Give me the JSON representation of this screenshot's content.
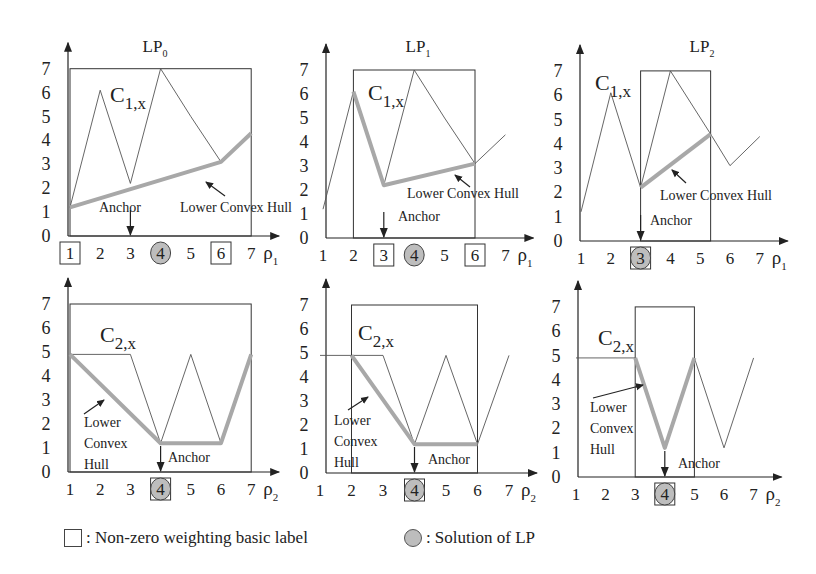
{
  "chart_data": [
    {
      "id": "lp0_c1",
      "type": "line",
      "title": "LP0",
      "title_main": "LP",
      "title_sub": "0",
      "curve_label_main": "C",
      "curve_label_sub": "1,x",
      "xlabel_main": "ρ",
      "xlabel_sub": "1",
      "x_ticks": [
        "1",
        "2",
        "3",
        "4",
        "5",
        "6",
        "7"
      ],
      "y_ticks": [
        "0",
        "1",
        "2",
        "3",
        "4",
        "5",
        "6",
        "7"
      ],
      "ylim": [
        0,
        7
      ],
      "curve": [
        [
          1,
          1.2
        ],
        [
          2,
          6.1
        ],
        [
          3,
          2.2
        ],
        [
          4,
          7
        ],
        [
          5,
          5
        ],
        [
          6,
          3.1
        ],
        [
          7,
          4.3
        ]
      ],
      "lower_convex_hull": [
        [
          1,
          1.2
        ],
        [
          6,
          3.1
        ],
        [
          7,
          4.3
        ]
      ],
      "box_x": [
        1,
        7
      ],
      "boxed_labels": [
        "1",
        "6"
      ],
      "solution_label": "4",
      "anchor_x": 3,
      "anchor_text": "Anchor",
      "hull_text": "Lower Convex Hull",
      "layout": {
        "ox": 68,
        "oy": 236,
        "x1": 70,
        "dx": 30.2,
        "dy": 23.9,
        "title_x": 155,
        "title_y": 52,
        "label_x": 110,
        "label_y": 102,
        "anchor_tx": 99,
        "anchor_ty": 212,
        "hull_tx": 180,
        "hull_ty": 212,
        "hull_arrow": [
          [
            225,
            196
          ],
          [
            206,
            182
          ]
        ]
      }
    },
    {
      "id": "lp1_c1",
      "type": "line",
      "title": "LP1",
      "title_main": "LP",
      "title_sub": "1",
      "curve_label_main": "C",
      "curve_label_sub": "1,x",
      "xlabel_main": "ρ",
      "xlabel_sub": "1",
      "x_ticks": [
        "1",
        "2",
        "3",
        "4",
        "5",
        "6",
        "7"
      ],
      "y_ticks": [
        "0",
        "1",
        "2",
        "3",
        "4",
        "5",
        "6",
        "7"
      ],
      "ylim": [
        0,
        7
      ],
      "curve": [
        [
          1,
          1.2
        ],
        [
          2,
          6.1
        ],
        [
          3,
          2.2
        ],
        [
          4,
          7
        ],
        [
          5,
          5
        ],
        [
          6,
          3.1
        ],
        [
          7,
          4.3
        ]
      ],
      "lower_convex_hull": [
        [
          2,
          6.1
        ],
        [
          3,
          2.2
        ],
        [
          6,
          3.1
        ]
      ],
      "box_x": [
        2,
        6
      ],
      "boxed_labels": [
        "3",
        "6"
      ],
      "solution_label": "4",
      "anchor_x": 3,
      "anchor_text": "Anchor",
      "hull_text": "Lower Convex Hull",
      "layout": {
        "ox": 326,
        "oy": 238,
        "x1": 323,
        "dx": 30.4,
        "dy": 24,
        "title_x": 418,
        "title_y": 52,
        "label_x": 368,
        "label_y": 100,
        "anchor_tx": 398,
        "anchor_ty": 221,
        "hull_tx": 407,
        "hull_ty": 198,
        "hull_arrow": [
          [
            470,
            187
          ],
          [
            455,
            175
          ]
        ]
      }
    },
    {
      "id": "lp2_c1",
      "type": "line",
      "title": "LP2",
      "title_main": "LP",
      "title_sub": "2",
      "curve_label_main": "C",
      "curve_label_sub": "1,x",
      "xlabel_main": "ρ",
      "xlabel_sub": "1",
      "x_ticks": [
        "1",
        "2",
        "3",
        "4",
        "5",
        "6",
        "7"
      ],
      "y_ticks": [
        "0",
        "1",
        "2",
        "3",
        "4",
        "5",
        "6",
        "7"
      ],
      "ylim": [
        0,
        7
      ],
      "curve": [
        [
          1,
          1.2
        ],
        [
          2,
          6.1
        ],
        [
          3,
          2.2
        ],
        [
          4,
          7
        ],
        [
          5.35,
          4.4
        ],
        [
          6,
          3.1
        ],
        [
          7,
          4.3
        ]
      ],
      "lower_convex_hull": [
        [
          3,
          2.2
        ],
        [
          5.35,
          4.4
        ]
      ],
      "box_x": [
        3,
        5.35
      ],
      "boxed_labels": [
        "3"
      ],
      "solution_label": "3",
      "anchor_x": 3,
      "anchor_text": "Anchor",
      "hull_text": "Lower Convex Hull",
      "layout": {
        "ox": 580,
        "oy": 241,
        "x1": 581,
        "dx": 29.8,
        "dy": 24.3,
        "title_x": 702,
        "title_y": 52,
        "label_x": 595,
        "label_y": 90,
        "anchor_tx": 650,
        "anchor_ty": 225,
        "hull_tx": 660,
        "hull_ty": 200,
        "hull_arrow": [
          [
            686,
            183
          ],
          [
            672,
            170
          ]
        ]
      }
    },
    {
      "id": "lp0_c2",
      "type": "line",
      "curve_label_main": "C",
      "curve_label_sub": "2,x",
      "xlabel_main": "ρ",
      "xlabel_sub": "2",
      "x_ticks": [
        "1",
        "2",
        "3",
        "4",
        "5",
        "6",
        "7"
      ],
      "y_ticks": [
        "0",
        "1",
        "2",
        "3",
        "4",
        "5",
        "6",
        "7"
      ],
      "ylim": [
        0,
        7
      ],
      "curve": [
        [
          1,
          4.9
        ],
        [
          3,
          4.9
        ],
        [
          4,
          1.2
        ],
        [
          5,
          4.9
        ],
        [
          6,
          1.2
        ],
        [
          7,
          4.9
        ]
      ],
      "lower_convex_hull": [
        [
          1,
          4.9
        ],
        [
          4,
          1.2
        ],
        [
          6,
          1.2
        ],
        [
          7,
          4.9
        ]
      ],
      "box_x": [
        1,
        7
      ],
      "boxed_labels": [
        "4"
      ],
      "solution_label": "4",
      "anchor_x": 4,
      "anchor_text": "Anchor",
      "hull_text": [
        "Lower",
        "Convex",
        "Hull"
      ],
      "layout": {
        "ox": 68,
        "oy": 472,
        "x1": 70,
        "dx": 30.2,
        "dy": 24,
        "label_x": 100,
        "label_y": 342,
        "anchor_tx": 168,
        "anchor_ty": 462,
        "hull_tx": 84,
        "hull_ty": 427,
        "hull_arrow": [
          [
            84,
            414
          ],
          [
            104,
            400
          ]
        ]
      }
    },
    {
      "id": "lp1_c2",
      "type": "line",
      "curve_label_main": "C",
      "curve_label_sub": "2,x",
      "xlabel_main": "ρ",
      "xlabel_sub": "2",
      "x_ticks": [
        "1",
        "2",
        "3",
        "4",
        "5",
        "6",
        "7"
      ],
      "y_ticks": [
        "0",
        "1",
        "2",
        "3",
        "4",
        "5",
        "6",
        "7"
      ],
      "ylim": [
        0,
        7
      ],
      "curve": [
        [
          1,
          4.9
        ],
        [
          3,
          4.9
        ],
        [
          4,
          1.2
        ],
        [
          5,
          4.9
        ],
        [
          6,
          1.2
        ],
        [
          7,
          4.9
        ]
      ],
      "lower_convex_hull": [
        [
          2,
          4.9
        ],
        [
          4,
          1.2
        ],
        [
          6,
          1.2
        ]
      ],
      "box_x": [
        2,
        6
      ],
      "boxed_labels": [
        "4"
      ],
      "solution_label": "4",
      "anchor_x": 4,
      "anchor_text": "Anchor",
      "hull_text": [
        "Lower",
        "Convex",
        "Hull"
      ],
      "layout": {
        "ox": 326,
        "oy": 473,
        "x1": 320,
        "dx": 31.5,
        "dy": 24,
        "label_x": 358,
        "label_y": 340,
        "anchor_tx": 428,
        "anchor_ty": 464,
        "hull_tx": 334,
        "hull_ty": 425,
        "hull_arrow": [
          [
            348,
            410
          ],
          [
            368,
            397
          ]
        ]
      }
    },
    {
      "id": "lp2_c2",
      "type": "line",
      "curve_label_main": "C",
      "curve_label_sub": "2,x",
      "xlabel_main": "ρ",
      "xlabel_sub": "2",
      "x_ticks": [
        "1",
        "2",
        "3",
        "4",
        "5",
        "6",
        "7"
      ],
      "y_ticks": [
        "0",
        "1",
        "2",
        "3",
        "4",
        "5",
        "6",
        "7"
      ],
      "ylim": [
        0,
        7
      ],
      "curve": [
        [
          1,
          4.9
        ],
        [
          3,
          4.9
        ],
        [
          4,
          1.2
        ],
        [
          5,
          4.9
        ],
        [
          6,
          1.2
        ],
        [
          7,
          4.9
        ]
      ],
      "lower_convex_hull": [
        [
          3,
          4.9
        ],
        [
          4,
          1.2
        ],
        [
          5,
          4.9
        ]
      ],
      "box_x": [
        3,
        5
      ],
      "boxed_labels": [
        "4"
      ],
      "solution_label": "4",
      "anchor_x": 4,
      "anchor_text": "Anchor",
      "hull_text": [
        "Lower",
        "Convex",
        "Hull"
      ],
      "layout": {
        "ox": 578,
        "oy": 477,
        "x1": 576,
        "dx": 29.6,
        "dy": 24.3,
        "label_x": 598,
        "label_y": 345,
        "anchor_tx": 678,
        "anchor_ty": 468,
        "hull_tx": 590,
        "hull_ty": 412,
        "hull_arrow": [
          [
            593,
            398
          ],
          [
            643,
            385
          ]
        ]
      }
    }
  ],
  "legend": {
    "box_text": ": Non-zero weighting basic label",
    "circle_text": ": Solution of LP"
  },
  "colors": {
    "axis": "#222222",
    "curve": "#555555",
    "hull": "#a8a8a8",
    "solution_fill": "#bdbdbd"
  }
}
